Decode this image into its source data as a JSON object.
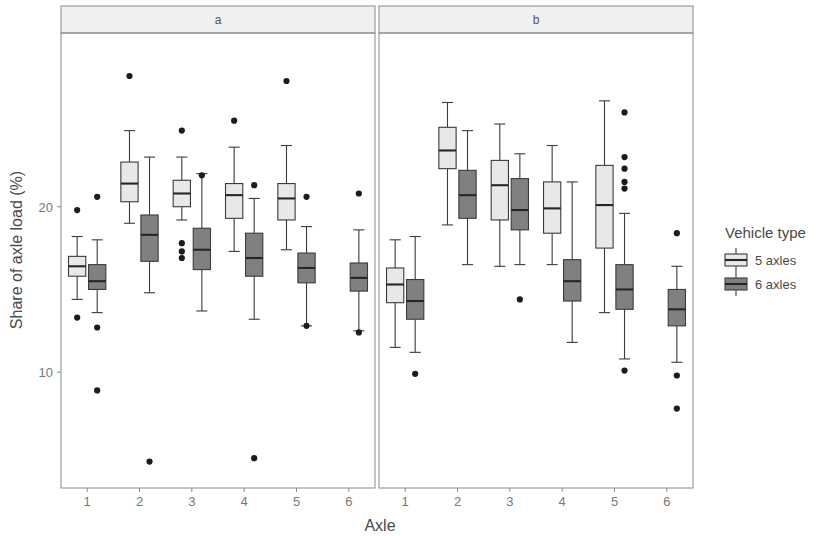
{
  "chart_data": {
    "type": "box",
    "title": "",
    "xlabel": "Axle",
    "ylabel": "Share of axle load (%)",
    "ylim": [
      3.0,
      30.5
    ],
    "yticks": [
      10,
      20
    ],
    "ytick_labels": [
      "10",
      "20"
    ],
    "xticks": [
      1,
      2,
      3,
      4,
      5,
      6
    ],
    "xtick_labels": [
      "1",
      "2",
      "3",
      "4",
      "5",
      "6"
    ],
    "grid": false,
    "legend": {
      "title": "Vehicle type",
      "position": "right",
      "entries": [
        {
          "label": "5 axles",
          "color": "#e8e8e8"
        },
        {
          "label": "6 axles",
          "color": "#808080"
        }
      ]
    },
    "panels": [
      {
        "label": "a",
        "groups": [
          {
            "x": 1,
            "series": [
              {
                "name": "5 axles",
                "min": 14.4,
                "q1": 15.8,
                "median": 16.4,
                "q3": 17.0,
                "max": 18.2,
                "outliers": [
                  19.8,
                  13.3
                ]
              },
              {
                "name": "6 axles",
                "min": 13.6,
                "q1": 15.0,
                "median": 15.5,
                "q3": 16.5,
                "max": 18.0,
                "outliers": [
                  20.6,
                  12.7,
                  8.9
                ]
              }
            ]
          },
          {
            "x": 2,
            "series": [
              {
                "name": "5 axles",
                "min": 19.0,
                "q1": 20.3,
                "median": 21.4,
                "q3": 22.7,
                "max": 24.6,
                "outliers": [
                  27.9
                ]
              },
              {
                "name": "6 axles",
                "min": 14.8,
                "q1": 16.7,
                "median": 18.3,
                "q3": 19.5,
                "max": 23.0,
                "outliers": [
                  4.6
                ]
              }
            ]
          },
          {
            "x": 3,
            "series": [
              {
                "name": "5 axles",
                "min": 19.2,
                "q1": 20.0,
                "median": 20.8,
                "q3": 21.6,
                "max": 23.0,
                "outliers": [
                  24.6,
                  17.8,
                  17.3,
                  16.9
                ]
              },
              {
                "name": "6 axles",
                "min": 13.7,
                "q1": 16.2,
                "median": 17.4,
                "q3": 18.7,
                "max": 22.0,
                "outliers": [
                  21.9
                ]
              }
            ]
          },
          {
            "x": 4,
            "series": [
              {
                "name": "5 axles",
                "min": 17.3,
                "q1": 19.3,
                "median": 20.7,
                "q3": 21.4,
                "max": 23.6,
                "outliers": [
                  25.2
                ]
              },
              {
                "name": "6 axles",
                "min": 13.2,
                "q1": 15.8,
                "median": 16.9,
                "q3": 18.4,
                "max": 20.5,
                "outliers": [
                  21.3,
                  4.8
                ]
              }
            ]
          },
          {
            "x": 5,
            "series": [
              {
                "name": "5 axles",
                "min": 17.4,
                "q1": 19.2,
                "median": 20.5,
                "q3": 21.4,
                "max": 23.7,
                "outliers": [
                  27.6
                ]
              },
              {
                "name": "6 axles",
                "min": 12.8,
                "q1": 15.4,
                "median": 16.3,
                "q3": 17.2,
                "max": 18.8,
                "outliers": [
                  20.6,
                  12.8
                ]
              }
            ]
          },
          {
            "x": 6,
            "series": [
              {
                "name": "5 axles",
                "min": null,
                "q1": null,
                "median": null,
                "q3": null,
                "max": null,
                "outliers": []
              },
              {
                "name": "6 axles",
                "min": 12.5,
                "q1": 14.9,
                "median": 15.7,
                "q3": 16.6,
                "max": 18.6,
                "outliers": [
                  20.8,
                  12.4
                ]
              }
            ]
          }
        ]
      },
      {
        "label": "b",
        "groups": [
          {
            "x": 1,
            "series": [
              {
                "name": "5 axles",
                "min": 11.5,
                "q1": 14.2,
                "median": 15.3,
                "q3": 16.3,
                "max": 18.0,
                "outliers": []
              },
              {
                "name": "6 axles",
                "min": 11.2,
                "q1": 13.2,
                "median": 14.3,
                "q3": 15.6,
                "max": 18.2,
                "outliers": [
                  9.9
                ]
              }
            ]
          },
          {
            "x": 2,
            "series": [
              {
                "name": "5 axles",
                "min": 18.9,
                "q1": 22.3,
                "median": 23.4,
                "q3": 24.8,
                "max": 26.3,
                "outliers": []
              },
              {
                "name": "6 axles",
                "min": 16.5,
                "q1": 19.3,
                "median": 20.7,
                "q3": 22.2,
                "max": 24.6,
                "outliers": []
              }
            ]
          },
          {
            "x": 3,
            "series": [
              {
                "name": "5 axles",
                "min": 16.4,
                "q1": 19.2,
                "median": 21.3,
                "q3": 22.8,
                "max": 25.0,
                "outliers": []
              },
              {
                "name": "6 axles",
                "min": 16.5,
                "q1": 18.6,
                "median": 19.8,
                "q3": 21.7,
                "max": 23.2,
                "outliers": [
                  14.4
                ]
              }
            ]
          },
          {
            "x": 4,
            "series": [
              {
                "name": "5 axles",
                "min": 16.5,
                "q1": 18.4,
                "median": 19.9,
                "q3": 21.5,
                "max": 23.7,
                "outliers": []
              },
              {
                "name": "6 axles",
                "min": 11.8,
                "q1": 14.3,
                "median": 15.5,
                "q3": 16.8,
                "max": 21.5,
                "outliers": []
              }
            ]
          },
          {
            "x": 5,
            "series": [
              {
                "name": "5 axles",
                "min": 13.6,
                "q1": 17.5,
                "median": 20.1,
                "q3": 22.5,
                "max": 26.4,
                "outliers": []
              },
              {
                "name": "6 axles",
                "min": 10.8,
                "q1": 13.8,
                "median": 15.0,
                "q3": 16.5,
                "max": 19.6,
                "outliers": [
                  25.7,
                  23.0,
                  22.3,
                  21.5,
                  21.1,
                  10.1
                ]
              }
            ]
          },
          {
            "x": 6,
            "series": [
              {
                "name": "5 axles",
                "min": null,
                "q1": null,
                "median": null,
                "q3": null,
                "max": null,
                "outliers": []
              },
              {
                "name": "6 axles",
                "min": 10.6,
                "q1": 12.8,
                "median": 13.8,
                "q3": 15.0,
                "max": 16.4,
                "outliers": [
                  18.4,
                  9.8,
                  7.8
                ]
              }
            ]
          }
        ]
      }
    ]
  }
}
